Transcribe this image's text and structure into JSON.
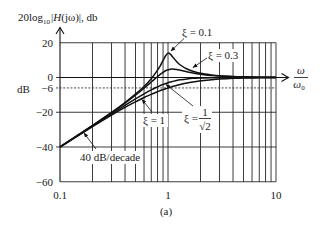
{
  "figure": {
    "ylabel_parts": {
      "pre": "20log",
      "sub": "10",
      "bar": "|",
      "italic": "H",
      "post": "(jω)|, db"
    },
    "unit_label": "dB",
    "xlabel_num": "ω",
    "xlabel_den": "ω",
    "xlabel_den_sub": "0",
    "caption": "(a)",
    "annotations": {
      "xi_01": "ξ = 0.1",
      "xi_03": "ξ = 0.3",
      "xi_1": "ξ = 1",
      "xi_sqrt2_prefix": "ξ =",
      "xi_sqrt2_num": "1",
      "xi_sqrt2_den": "√2",
      "slope": "40 dB/decade"
    }
  },
  "chart_data": {
    "type": "line",
    "title": "",
    "caption": "(a)",
    "xlabel": "ω/ω0",
    "ylabel": "20log10|H(jω)|, db",
    "y_unit": "dB",
    "xscale": "log",
    "xlim": [
      0.1,
      10
    ],
    "ylim": [
      -60,
      20
    ],
    "x_ticks": [
      0.1,
      1,
      10
    ],
    "x_tick_labels": [
      "0.1",
      "1",
      "10"
    ],
    "y_ticks": [
      20,
      0,
      -6,
      -20,
      -40,
      -60
    ],
    "y_tick_labels": [
      "20",
      "0",
      "−6",
      "−20",
      "−40",
      "−60"
    ],
    "reference_lines": [
      {
        "y": -6,
        "style": "dashed"
      }
    ],
    "grid": true,
    "legend": "none (inline annotations with arrows)",
    "x": [
      0.1,
      0.15,
      0.2,
      0.3,
      0.4,
      0.5,
      0.6,
      0.7,
      0.8,
      0.85,
      0.9,
      0.95,
      1.0,
      1.05,
      1.1,
      1.2,
      1.3,
      1.5,
      1.7,
      2,
      2.5,
      3,
      4,
      5,
      7,
      10
    ],
    "series": [
      {
        "name": "ξ = 0.1",
        "zeta": 0.1,
        "values": [
          -39.9,
          -32.8,
          -27.6,
          -20.1,
          -14.4,
          -9.6,
          -5.2,
          -0.7,
          4.2,
          6.9,
          9.8,
          12.5,
          14.0,
          13.5,
          12.0,
          9.2,
          7.2,
          4.9,
          3.6,
          2.4,
          1.5,
          1.0,
          0.6,
          0.4,
          0.2,
          0.1
        ]
      },
      {
        "name": "ξ = 0.3",
        "zeta": 0.3,
        "values": [
          -39.9,
          -32.8,
          -27.7,
          -20.3,
          -14.7,
          -10.2,
          -6.2,
          -2.6,
          0.6,
          1.9,
          3.0,
          3.9,
          4.4,
          4.8,
          4.9,
          4.6,
          4.2,
          3.3,
          2.6,
          1.9,
          1.2,
          0.8,
          0.5,
          0.3,
          0.1,
          0.1
        ]
      },
      {
        "name": "ξ = 1/√2",
        "zeta": 0.707,
        "values": [
          -40.0,
          -33.0,
          -28.0,
          -21.0,
          -16.0,
          -12.3,
          -9.4,
          -7.1,
          -5.4,
          -4.6,
          -4.0,
          -3.5,
          -3.0,
          -2.6,
          -2.3,
          -1.7,
          -1.3,
          -0.8,
          -0.5,
          -0.3,
          -0.1,
          -0.1,
          0.0,
          0.0,
          0.0,
          0.0
        ]
      },
      {
        "name": "ξ = 1",
        "zeta": 1.0,
        "values": [
          -40.1,
          -33.2,
          -28.3,
          -21.7,
          -17.2,
          -14.0,
          -11.5,
          -9.7,
          -8.2,
          -7.5,
          -7.0,
          -6.5,
          -6.0,
          -5.6,
          -5.2,
          -4.6,
          -4.0,
          -3.2,
          -2.6,
          -1.9,
          -1.3,
          -0.9,
          -0.5,
          -0.3,
          -0.2,
          -0.1
        ]
      }
    ],
    "annotations": [
      {
        "text": "ξ = 0.1",
        "points_to": "resonant peak ≈ 14 dB at ω/ω0 = 1"
      },
      {
        "text": "ξ = 0.3",
        "points_to": "ξ = 0.3 curve"
      },
      {
        "text": "ξ = 1/√2",
        "points_to": "ξ = 0.707 curve (−3 dB at ω/ω0 = 1)"
      },
      {
        "text": "ξ = 1",
        "points_to": "ξ = 1 curve (−6 dB at ω/ω0 = 1)"
      },
      {
        "text": "40 dB/decade",
        "points_to": "low-frequency asymptote"
      }
    ]
  }
}
